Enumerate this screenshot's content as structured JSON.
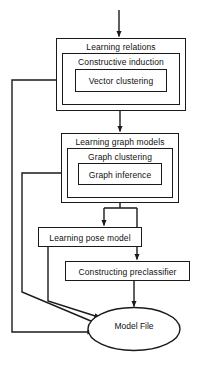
{
  "diagram": {
    "background_color": "#ffffff",
    "stroke_color": "#1a1a1a",
    "text_color": "#111111"
  },
  "nodes": {
    "learning_relations": {
      "label": "Learning relations",
      "shape": "rectangle",
      "level": "outer"
    },
    "constructive_induction": {
      "label": "Constructive induction",
      "shape": "rectangle",
      "level": "middle"
    },
    "vector_clustering": {
      "label": "Vector clustering",
      "shape": "rectangle",
      "level": "inner"
    },
    "learning_graph_models": {
      "label": "Learning graph models",
      "shape": "rectangle",
      "level": "outer"
    },
    "graph_clustering": {
      "label": "Graph clustering",
      "shape": "rectangle",
      "level": "middle"
    },
    "graph_inference": {
      "label": "Graph inference",
      "shape": "rectangle",
      "level": "inner"
    },
    "learning_pose_model": {
      "label": "Learning pose model",
      "shape": "rectangle",
      "level": "outer"
    },
    "constructing_preclassifier": {
      "label": "Constructing preclassifier",
      "shape": "rectangle",
      "level": "outer"
    },
    "model_file": {
      "label": "Model File",
      "shape": "ellipse",
      "level": "terminal"
    }
  },
  "edges": [
    {
      "name": "input-to-learning-relations",
      "from": "input",
      "to": "learning_relations",
      "arrow": true
    },
    {
      "name": "learning-relations-to-learning-graph-models",
      "from": "learning_relations",
      "to": "learning_graph_models",
      "arrow": true
    },
    {
      "name": "learning-graph-models-to-learning-pose-model",
      "from": "learning_graph_models",
      "to": "learning_pose_model",
      "arrow": true
    },
    {
      "name": "learning-graph-models-to-constructing-preclassifier",
      "from": "learning_graph_models",
      "to": "constructing_preclassifier",
      "arrow": true
    },
    {
      "name": "constructing-preclassifier-to-model-file",
      "from": "constructing_preclassifier",
      "to": "model_file",
      "arrow": true
    },
    {
      "name": "learning-pose-model-to-model-file",
      "from": "learning_pose_model",
      "to": "model_file",
      "arrow": true
    },
    {
      "name": "graph-clustering-feedback-to-model-file",
      "from": "graph_clustering",
      "to": "model_file",
      "arrow": true
    },
    {
      "name": "constructive-induction-feedback-to-model-file",
      "from": "constructive_induction",
      "to": "model_file",
      "arrow": true
    }
  ]
}
